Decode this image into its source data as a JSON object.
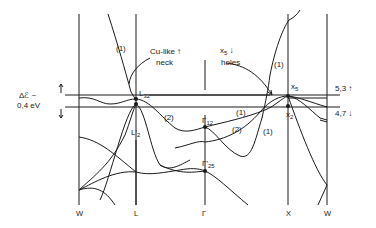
{
  "diagram": {
    "type": "band-structure",
    "high_symmetry_points": [
      "W",
      "L",
      "Γ",
      "X",
      "W"
    ],
    "energy_window": {
      "label_line1": "Δℰ ~",
      "label_line2": "0,4 eV"
    },
    "level_labels": {
      "upper": "5,3",
      "lower": "4,7",
      "upper_arrow": "↑",
      "lower_arrow": "↓"
    },
    "point_labels": {
      "L32": {
        "main": "L",
        "sub": "32"
      },
      "L2p": {
        "main": "L'",
        "sub": "2"
      },
      "G12": {
        "main": "Γ",
        "sub": "12"
      },
      "G25p": {
        "main": "Γ'",
        "sub": "25"
      },
      "X5": {
        "main": "x",
        "sub": "5"
      },
      "X2": {
        "main": "x",
        "sub": "2"
      }
    },
    "annotations": {
      "cu_like_line1": "Cu-like ↑",
      "cu_like_line2": "neck",
      "x5_line1": "x",
      "x5_sub": "5",
      "x5_arrow": " ↓",
      "x5_line2": "holes"
    },
    "band_labels": {
      "b1a": "(1)",
      "b2a": "(2)",
      "b1b": "(1)",
      "b2b": "(2)",
      "b1c": "(1)",
      "b1d": "(1)"
    }
  }
}
